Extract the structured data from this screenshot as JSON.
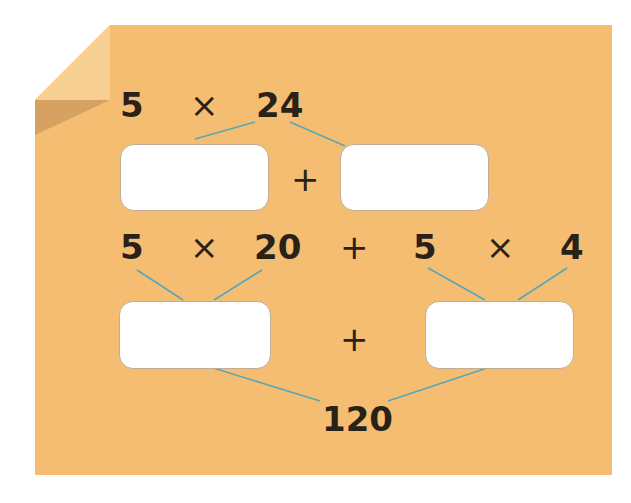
{
  "colors": {
    "paper": "#f5bd72",
    "fold": "#f8cf93",
    "fold_shadow": "#c9975a",
    "connector": "#5aa6b5",
    "text": "#2a2218",
    "box": "#ffffff"
  },
  "row1": {
    "a": "5",
    "op": "×",
    "b": "24"
  },
  "row2": {
    "plus": "+"
  },
  "row3": {
    "a": "5",
    "op1": "×",
    "b": "20",
    "plus": "+",
    "c": "5",
    "op2": "×",
    "d": "4"
  },
  "row4": {
    "plus": "+"
  },
  "result": "120",
  "answer_boxes": [
    {
      "id": "box-5x20",
      "value": ""
    },
    {
      "id": "box-5x4",
      "value": ""
    },
    {
      "id": "box-a",
      "value": ""
    },
    {
      "id": "box-b",
      "value": ""
    }
  ]
}
